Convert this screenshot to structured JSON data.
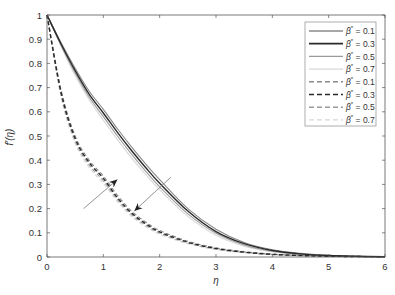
{
  "chart_data": {
    "type": "line",
    "title": "",
    "xlabel": "η",
    "ylabel": "f'(η)",
    "xlim": [
      0,
      6
    ],
    "ylim": [
      0,
      1
    ],
    "xticks": [
      0,
      1,
      2,
      3,
      4,
      5,
      6
    ],
    "yticks": [
      0,
      0.1,
      0.2,
      0.3,
      0.4,
      0.5,
      0.6,
      0.7,
      0.8,
      0.9,
      1
    ],
    "grid": false,
    "legend_position": "upper right",
    "x": [
      0,
      0.25,
      0.5,
      0.75,
      1,
      1.25,
      1.5,
      1.75,
      2,
      2.5,
      3,
      3.5,
      4,
      4.5,
      5,
      5.5,
      6
    ],
    "series": [
      {
        "name": "β* = 0.1",
        "style": "solid",
        "color": "#8a8a8a",
        "width": 1.1,
        "values": [
          1,
          0.885,
          0.78,
          0.685,
          0.61,
          0.53,
          0.455,
          0.385,
          0.32,
          0.2,
          0.115,
          0.06,
          0.03,
          0.015,
          0.007,
          0.003,
          0.001
        ]
      },
      {
        "name": "β* = 0.3",
        "style": "solid",
        "color": "#2a2a2a",
        "width": 1.4,
        "values": [
          1,
          0.88,
          0.77,
          0.672,
          0.595,
          0.515,
          0.44,
          0.37,
          0.305,
          0.19,
          0.105,
          0.055,
          0.027,
          0.013,
          0.006,
          0.003,
          0.001
        ]
      },
      {
        "name": "β* = 0.5",
        "style": "solid",
        "color": "#9a9a9a",
        "width": 1.1,
        "values": [
          1,
          0.875,
          0.76,
          0.66,
          0.58,
          0.5,
          0.425,
          0.355,
          0.29,
          0.178,
          0.098,
          0.05,
          0.024,
          0.011,
          0.005,
          0.002,
          0.001
        ]
      },
      {
        "name": "β* = 0.7",
        "style": "solid",
        "color": "#d8d8d8",
        "width": 1.1,
        "values": [
          1,
          0.87,
          0.75,
          0.65,
          0.565,
          0.485,
          0.41,
          0.342,
          0.278,
          0.168,
          0.09,
          0.045,
          0.021,
          0.01,
          0.004,
          0.002,
          0.001
        ]
      },
      {
        "name": "β* = 0.1",
        "style": "dashed",
        "color": "#8a8a8a",
        "width": 1.1,
        "values": [
          1,
          0.69,
          0.5,
          0.4,
          0.335,
          0.255,
          0.19,
          0.145,
          0.11,
          0.065,
          0.038,
          0.022,
          0.012,
          0.007,
          0.004,
          0.002,
          0.001
        ]
      },
      {
        "name": "β* = 0.3",
        "style": "dashed",
        "color": "#2a2a2a",
        "width": 1.4,
        "values": [
          1,
          0.68,
          0.49,
          0.39,
          0.325,
          0.245,
          0.182,
          0.138,
          0.104,
          0.061,
          0.035,
          0.02,
          0.011,
          0.006,
          0.003,
          0.002,
          0.001
        ]
      },
      {
        "name": "β* = 0.5",
        "style": "dashed",
        "color": "#9a9a9a",
        "width": 1.1,
        "values": [
          1,
          0.67,
          0.48,
          0.38,
          0.315,
          0.237,
          0.175,
          0.132,
          0.099,
          0.058,
          0.033,
          0.019,
          0.01,
          0.006,
          0.003,
          0.001,
          0.001
        ]
      },
      {
        "name": "β* = 0.7",
        "style": "dashed",
        "color": "#d8d8d8",
        "width": 1.1,
        "values": [
          1,
          0.66,
          0.47,
          0.37,
          0.305,
          0.229,
          0.168,
          0.126,
          0.094,
          0.055,
          0.031,
          0.018,
          0.01,
          0.005,
          0.003,
          0.001,
          0.001
        ]
      }
    ],
    "annotations": [
      {
        "type": "arrow",
        "label": "increasing β* (dashed)",
        "from": [
          0.65,
          0.2
        ],
        "to": [
          1.25,
          0.32
        ]
      },
      {
        "type": "arrow",
        "label": "increasing β* (solid)",
        "from": [
          2.2,
          0.33
        ],
        "to": [
          1.55,
          0.19
        ]
      }
    ]
  },
  "legend": {
    "entries": [
      {
        "prefix": "β",
        "sup": "*",
        "suffix": " = 0.1"
      },
      {
        "prefix": "β",
        "sup": "*",
        "suffix": " = 0.3"
      },
      {
        "prefix": "β",
        "sup": "*",
        "suffix": " = 0.5"
      },
      {
        "prefix": "β",
        "sup": "*",
        "suffix": " = 0.7"
      },
      {
        "prefix": "β",
        "sup": "*",
        "suffix": " = 0.1"
      },
      {
        "prefix": "β",
        "sup": "*",
        "suffix": " = 0.3"
      },
      {
        "prefix": "β",
        "sup": "*",
        "suffix": " = 0.5"
      },
      {
        "prefix": "β",
        "sup": "*",
        "suffix": " = 0.7"
      }
    ]
  },
  "colors": {
    "axis": "#555555",
    "arrow_line": "#888888",
    "arrow_head": "#222222"
  }
}
